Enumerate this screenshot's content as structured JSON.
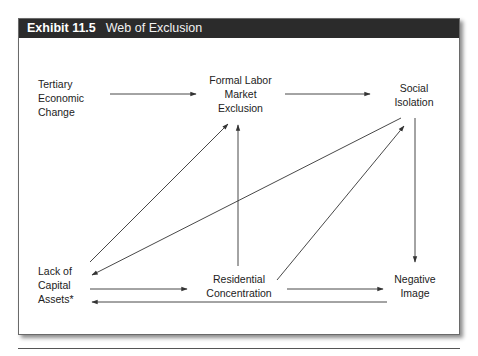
{
  "exhibit": {
    "number": "Exhibit 11.5",
    "title": "Web of Exclusion"
  },
  "nodes": {
    "tertiary": {
      "lines": [
        "Tertiary",
        "Economic",
        "Change"
      ]
    },
    "formal": {
      "lines": [
        "Formal Labor",
        "Market",
        "Exclusion"
      ]
    },
    "social": {
      "lines": [
        "Social",
        "Isolation"
      ]
    },
    "capital": {
      "lines": [
        "Lack of",
        "Capital",
        "Assets*"
      ]
    },
    "residential": {
      "lines": [
        "Residential",
        "Concentration"
      ]
    },
    "negative": {
      "lines": [
        "Negative",
        "Image"
      ]
    }
  },
  "edges": [
    {
      "from": "Tertiary Economic Change",
      "to": "Formal Labor Market Exclusion"
    },
    {
      "from": "Formal Labor Market Exclusion",
      "to": "Social Isolation"
    },
    {
      "from": "Social Isolation",
      "to": "Negative Image"
    },
    {
      "from": "Social Isolation",
      "to": "Lack of Capital Assets*"
    },
    {
      "from": "Lack of Capital Assets*",
      "to": "Formal Labor Market Exclusion"
    },
    {
      "from": "Residential Concentration",
      "to": "Formal Labor Market Exclusion"
    },
    {
      "from": "Residential Concentration",
      "to": "Social Isolation"
    },
    {
      "from": "Lack of Capital Assets*",
      "to": "Residential Concentration"
    },
    {
      "from": "Residential Concentration",
      "to": "Negative Image"
    },
    {
      "from": "Negative Image",
      "to": "Lack of Capital Assets*"
    }
  ],
  "colors": {
    "header_bg": "#2b2b2b",
    "header_text": "#ffffff",
    "line": "#333333"
  }
}
